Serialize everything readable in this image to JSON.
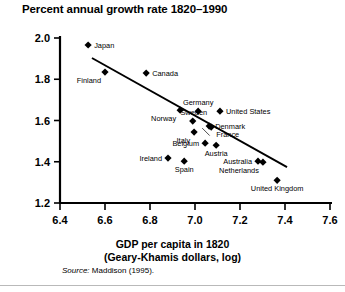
{
  "chart": {
    "title": "Percent annual growth rate 1820–1990",
    "xlabel_line1": "GDP per capita in 1820",
    "xlabel_line2": "(Geary-Khamis dollars, log)",
    "source_prefix": "Source:",
    "source_text": "Maddison (1995)."
  },
  "chart_data": {
    "type": "scatter",
    "title": "Percent annual growth rate 1820–1990",
    "xlabel": "GDP per capita in 1820 (Geary-Khamis dollars, log)",
    "ylabel": "Percent annual growth rate 1820–1990",
    "xlim": [
      6.4,
      7.6
    ],
    "ylim": [
      1.2,
      2.0
    ],
    "xticks": [
      6.4,
      6.6,
      6.8,
      7.0,
      7.2,
      7.4,
      7.6
    ],
    "yticks": [
      1.2,
      1.4,
      1.6,
      1.8,
      2.0
    ],
    "grid": false,
    "legend": "none",
    "marker": "filled-diamond",
    "points": [
      {
        "label": "Japan",
        "x": 6.525,
        "y": 1.966,
        "label_pos": "right"
      },
      {
        "label": "Finland",
        "x": 6.6,
        "y": 1.835,
        "label_pos": "below-left"
      },
      {
        "label": "Canada",
        "x": 6.783,
        "y": 1.83,
        "label_pos": "right"
      },
      {
        "label": "Norway",
        "x": 6.934,
        "y": 1.65,
        "label_pos": "below-left"
      },
      {
        "label": "Germany",
        "x": 7.014,
        "y": 1.645,
        "label_pos": "above"
      },
      {
        "label": "United States",
        "x": 7.111,
        "y": 1.645,
        "label_pos": "right"
      },
      {
        "label": "Sweden",
        "x": 6.99,
        "y": 1.597,
        "label_pos": "above-right"
      },
      {
        "label": "Denmark",
        "x": 7.063,
        "y": 1.573,
        "label_pos": "right"
      },
      {
        "label": "Italy",
        "x": 6.996,
        "y": 1.544,
        "label_pos": "below-left"
      },
      {
        "label": "France",
        "x": 7.072,
        "y": 1.568,
        "label_pos": "below-right"
      },
      {
        "label": "Belgium",
        "x": 7.045,
        "y": 1.49,
        "label_pos": "left"
      },
      {
        "label": "Austria",
        "x": 7.094,
        "y": 1.48,
        "label_pos": "below"
      },
      {
        "label": "Ireland",
        "x": 6.88,
        "y": 1.418,
        "label_pos": "left"
      },
      {
        "label": "Spain",
        "x": 6.952,
        "y": 1.403,
        "label_pos": "below"
      },
      {
        "label": "Australia",
        "x": 7.28,
        "y": 1.403,
        "label_pos": "left"
      },
      {
        "label": "Netherlands",
        "x": 7.302,
        "y": 1.398,
        "label_pos": "below-left"
      },
      {
        "label": "United Kingdom",
        "x": 7.365,
        "y": 1.31,
        "label_pos": "below"
      }
    ],
    "trendline": {
      "type": "line",
      "x": [
        6.542,
        7.409
      ],
      "y": [
        1.903,
        1.374
      ]
    }
  }
}
